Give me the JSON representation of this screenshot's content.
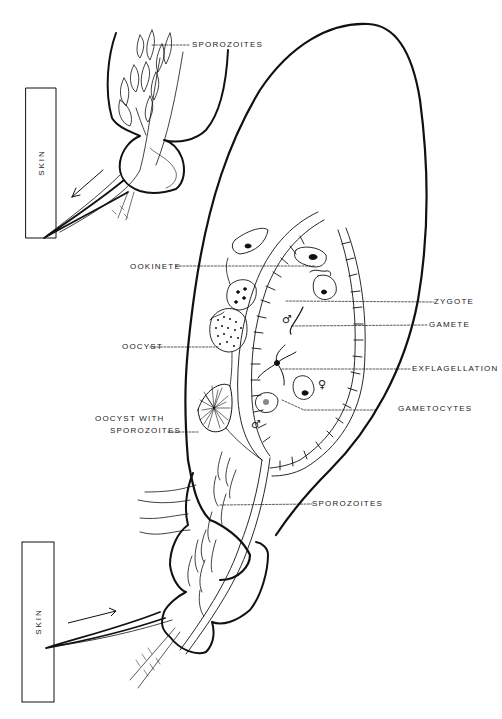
{
  "figure": {
    "caption": "Fig. ..."
  },
  "skin_boxes": [
    {
      "label": "SKIN",
      "position": "top"
    },
    {
      "label": "SKIN",
      "position": "bottom"
    }
  ],
  "labels": {
    "sporozoites_top": "SPOROZOITES",
    "ookinete": "OOKINETE",
    "zygote": "ZYGOTE",
    "gamete": "GAMETE",
    "oocyst": "OOCYST",
    "exflagellation": "EXFLAGELLATION",
    "gametocytes": "GAMETOCYTES",
    "oocyst_with_line1": "OOCYST  WITH",
    "oocyst_with_line2": "SPOROZOITES",
    "sporozoites_bottom": "SPOROZOITES"
  },
  "symbols": {
    "male": "♂",
    "female": "♀"
  },
  "arrows": [
    {
      "direction": "away-from-skin-to-lower-left",
      "position": "top"
    },
    {
      "direction": "toward-mosquito",
      "position": "bottom"
    }
  ]
}
